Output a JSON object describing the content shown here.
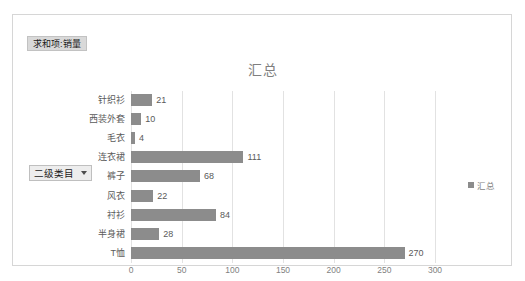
{
  "window": {
    "background": "#ffffff",
    "frame_border_color": "#d6d6d6"
  },
  "pivot": {
    "value_field_button": "求和项:销量",
    "axis_field_button": "二级类目",
    "axis_field_caret_icon": "chevron-down-icon"
  },
  "chart": {
    "title": "汇总",
    "legend": {
      "position": "right",
      "entries": [
        "汇总"
      ]
    },
    "series_color": "#8c8c8c",
    "grid_color": "#e2e2e2",
    "label_color": "#5a5a5a"
  },
  "chart_data": {
    "type": "bar",
    "orientation": "horizontal",
    "title": "汇总",
    "xlabel": "",
    "ylabel": "",
    "categories": [
      "针织衫",
      "西装外套",
      "毛衣",
      "连衣裙",
      "裤子",
      "风衣",
      "衬衫",
      "半身裙",
      "T恤"
    ],
    "values": [
      21,
      10,
      4,
      111,
      68,
      22,
      84,
      28,
      270
    ],
    "series": [
      {
        "name": "汇总",
        "values": [
          21,
          10,
          4,
          111,
          68,
          22,
          84,
          28,
          270
        ]
      }
    ],
    "data_labels": [
      "21",
      "10",
      "4",
      "111",
      "68",
      "22",
      "84",
      "28",
      "270"
    ],
    "xlim": [
      0,
      300
    ],
    "xticks": [
      0,
      50,
      100,
      150,
      200,
      250,
      300
    ],
    "xtick_labels": [
      "0",
      "50",
      "100",
      "150",
      "200",
      "250",
      "300"
    ],
    "grid": true,
    "legend_position": "right"
  }
}
